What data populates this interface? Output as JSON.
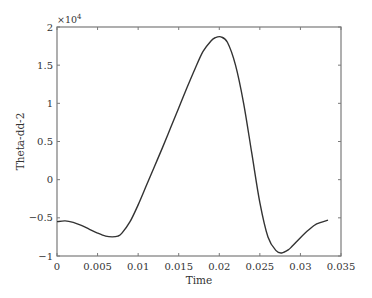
{
  "chart_data": {
    "type": "line",
    "title": "",
    "xlabel": "Time",
    "ylabel": "Theta-dd-2",
    "y_multiplier_label": "×10",
    "y_multiplier_exponent": "4",
    "xlim": [
      0,
      0.035
    ],
    "ylim": [
      -1,
      2
    ],
    "y_scale": 10000,
    "grid": false,
    "legend": null,
    "xticks": [
      0,
      0.005,
      0.01,
      0.015,
      0.02,
      0.025,
      0.03,
      0.035
    ],
    "xtick_labels": [
      "0",
      "0.005",
      "0.01",
      "0.015",
      "0.02",
      "0.025",
      "0.03",
      "0.035"
    ],
    "yticks": [
      -1,
      -0.5,
      0,
      0.5,
      1,
      1.5,
      2
    ],
    "ytick_labels": [
      "−1",
      "−0.5",
      "0",
      "0.5",
      "1",
      "1.5",
      "2"
    ],
    "series": [
      {
        "name": "Theta-dd-2",
        "color": "#333333",
        "x": [
          0,
          0.001,
          0.002,
          0.003,
          0.004,
          0.005,
          0.006,
          0.0068,
          0.0075,
          0.008,
          0.009,
          0.01,
          0.011,
          0.012,
          0.013,
          0.014,
          0.015,
          0.016,
          0.017,
          0.018,
          0.019,
          0.0195,
          0.0202,
          0.021,
          0.022,
          0.023,
          0.024,
          0.025,
          0.026,
          0.027,
          0.0277,
          0.0285,
          0.029,
          0.03,
          0.031,
          0.032,
          0.0334
        ],
        "y": [
          -0.55,
          -0.54,
          -0.56,
          -0.6,
          -0.65,
          -0.7,
          -0.74,
          -0.75,
          -0.74,
          -0.7,
          -0.55,
          -0.33,
          -0.08,
          0.17,
          0.42,
          0.68,
          0.94,
          1.2,
          1.45,
          1.68,
          1.82,
          1.86,
          1.87,
          1.8,
          1.5,
          1.0,
          0.35,
          -0.3,
          -0.75,
          -0.93,
          -0.96,
          -0.92,
          -0.87,
          -0.76,
          -0.66,
          -0.58,
          -0.53
        ]
      }
    ]
  }
}
